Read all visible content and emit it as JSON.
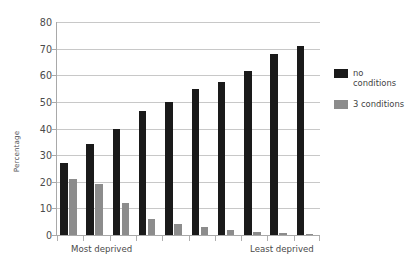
{
  "chart_data": {
    "type": "bar",
    "title": "",
    "xlabel": "",
    "ylabel": "Percentage",
    "ylim": [
      0,
      80
    ],
    "ytick_labels": [
      "80",
      "70",
      "60",
      "50",
      "40",
      "30",
      "20",
      "10",
      "0"
    ],
    "ytick_values": [
      80,
      70,
      60,
      50,
      40,
      30,
      20,
      10,
      0
    ],
    "grid": true,
    "legend_position": "right",
    "categories": [
      "1",
      "2",
      "3",
      "4",
      "5",
      "6",
      "7",
      "8",
      "9",
      "10"
    ],
    "x_axis_end_labels": {
      "left": "Most deprived",
      "right": "Least deprived"
    },
    "series": [
      {
        "name": "no conditions",
        "color": "#1a1a1a",
        "values": [
          27,
          34,
          40,
          46.5,
          50,
          55,
          57.5,
          61.5,
          68,
          71
        ]
      },
      {
        "name": "3 conditions",
        "color": "#8c8c8c",
        "values": [
          21,
          19,
          12,
          6,
          4,
          3,
          2,
          1,
          0.6,
          0.3
        ]
      }
    ]
  },
  "legend": {
    "entries": [
      {
        "label": "no\nconditions",
        "color": "#1a1a1a"
      },
      {
        "label": "3 conditions",
        "color": "#8c8c8c"
      }
    ]
  },
  "colors": {
    "background": "#ffffff",
    "gridline": "#c8c8c8",
    "axis": "#a9a9a9",
    "text": "#4a4a4a",
    "series_no_conditions": "#1a1a1a",
    "series_3_conditions": "#8c8c8c"
  }
}
